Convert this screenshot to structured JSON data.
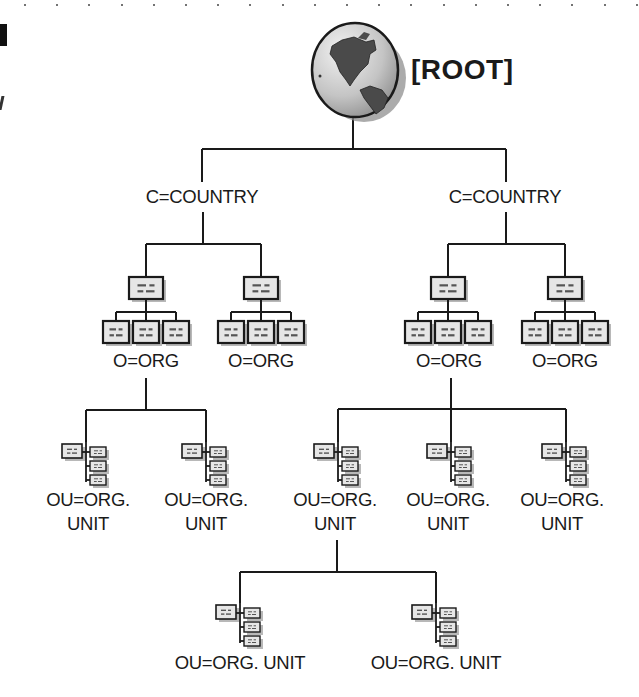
{
  "diagram": {
    "type": "directory-tree",
    "root": {
      "label": "[ROOT]",
      "icon": "globe-icon"
    },
    "levels": [
      "[ROOT]",
      "C=COUNTRY",
      "O=ORG",
      "OU=ORG. UNIT"
    ],
    "nodes": {
      "country_left": {
        "label": "C=COUNTRY"
      },
      "country_right": {
        "label": "C=COUNTRY"
      },
      "org_ll": {
        "label": "O=ORG",
        "icon": "org-chart-icon"
      },
      "org_lr": {
        "label": "O=ORG",
        "icon": "org-chart-icon"
      },
      "org_rl": {
        "label": "O=ORG",
        "icon": "org-chart-icon"
      },
      "org_rr": {
        "label": "O=ORG",
        "icon": "org-chart-icon"
      },
      "ou_1": {
        "line1": "OU=ORG.",
        "line2": "UNIT",
        "icon": "org-unit-icon"
      },
      "ou_2": {
        "line1": "OU=ORG.",
        "line2": "UNIT",
        "icon": "org-unit-icon"
      },
      "ou_3": {
        "line1": "OU=ORG.",
        "line2": "UNIT",
        "icon": "org-unit-icon"
      },
      "ou_4": {
        "line1": "OU=ORG.",
        "line2": "UNIT",
        "icon": "org-unit-icon"
      },
      "ou_5": {
        "line1": "OU=ORG.",
        "line2": "UNIT",
        "icon": "org-unit-icon"
      },
      "ou_6": {
        "label": "OU=ORG. UNIT",
        "icon": "org-unit-icon"
      },
      "ou_7": {
        "label": "OU=ORG. UNIT",
        "icon": "org-unit-icon"
      }
    },
    "edges": [
      [
        "root",
        "country_left"
      ],
      [
        "root",
        "country_right"
      ],
      [
        "country_left",
        "org_ll"
      ],
      [
        "country_left",
        "org_lr"
      ],
      [
        "country_right",
        "org_rl"
      ],
      [
        "country_right",
        "org_rr"
      ],
      [
        "org_ll",
        "ou_1"
      ],
      [
        "org_ll",
        "ou_2"
      ],
      [
        "org_rl",
        "ou_3"
      ],
      [
        "org_rl",
        "ou_4"
      ],
      [
        "org_rl",
        "ou_5"
      ],
      [
        "ou_3",
        "ou_6"
      ],
      [
        "ou_3",
        "ou_7"
      ]
    ]
  },
  "colors": {
    "line": "#1a1a1a",
    "box_fill": "#e6e6e6",
    "box_shadow": "#9a9a9a",
    "globe_ocean": "#c8c8c8",
    "globe_land": "#4a4a4a"
  }
}
